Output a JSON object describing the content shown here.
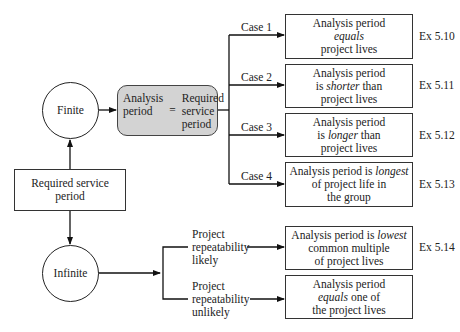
{
  "nodes": {
    "finite": "Finite",
    "infinite": "Infinite",
    "required_service": [
      "Required service",
      "period"
    ],
    "equation": {
      "left": [
        "Analysis",
        "period"
      ],
      "operator": "=",
      "right": [
        "Required",
        "service",
        "period"
      ]
    }
  },
  "cases": [
    {
      "label": "Case 1",
      "line1": "Analysis period",
      "line2_pre": "",
      "line2_em": "equals",
      "line2_post": "",
      "line3": "project lives",
      "example": "Ex 5.10"
    },
    {
      "label": "Case 2",
      "line1": "Analysis period",
      "line2_pre": "is ",
      "line2_em": "shorter",
      "line2_post": " than",
      "line3": "project lives",
      "example": "Ex 5.11"
    },
    {
      "label": "Case 3",
      "line1": "Analysis period",
      "line2_pre": "is ",
      "line2_em": "longer",
      "line2_post": " than",
      "line3": "project lives",
      "example": "Ex 5.12"
    },
    {
      "label": "Case 4",
      "line1_pre": "Analysis period is ",
      "line1_em": "longest",
      "line2": "of project life in",
      "line3": "the group",
      "example": "Ex 5.13"
    }
  ],
  "repeatability": [
    {
      "label": [
        "Project",
        "repeatability",
        "likely"
      ],
      "line1_pre": "Analysis period is ",
      "line1_em": "lowest",
      "line2": "common multiple",
      "line3": "of project lives",
      "example": "Ex 5.14"
    },
    {
      "label": [
        "Project",
        "repeatability",
        "unlikely"
      ],
      "line1": "Analysis period",
      "line2_em": "equals",
      "line2_post": " one of",
      "line3": "the project lives",
      "example": ""
    }
  ]
}
